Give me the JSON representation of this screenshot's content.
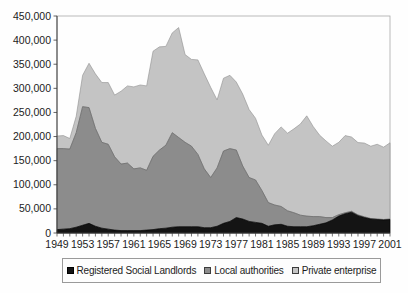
{
  "chart_data": {
    "type": "area",
    "stacked": true,
    "title": "",
    "xlabel": "",
    "ylabel": "",
    "grid": false,
    "legend_position": "bottom",
    "ylim": [
      0,
      450000
    ],
    "ytick_step": 50000,
    "ytick_labels": [
      "0",
      "50,000",
      "100,000",
      "150,000",
      "200,000",
      "250,000",
      "300,000",
      "350,000",
      "400,000",
      "450,000"
    ],
    "xtick_labels": [
      "1949",
      "1953",
      "1957",
      "1961",
      "1965",
      "1969",
      "1973",
      "1977",
      "1981",
      "1985",
      "1989",
      "1993",
      "1997",
      "2001"
    ],
    "x": [
      1949,
      1950,
      1951,
      1952,
      1953,
      1954,
      1955,
      1956,
      1957,
      1958,
      1959,
      1960,
      1961,
      1962,
      1963,
      1964,
      1965,
      1966,
      1967,
      1968,
      1969,
      1970,
      1971,
      1972,
      1973,
      1974,
      1975,
      1976,
      1977,
      1978,
      1979,
      1980,
      1981,
      1982,
      1983,
      1984,
      1985,
      1986,
      1987,
      1988,
      1989,
      1990,
      1991,
      1992,
      1993,
      1994,
      1995,
      1996,
      1997,
      1998,
      1999,
      2000,
      2001
    ],
    "series": [
      {
        "name": "Registered Social Landlords",
        "color": "#141414",
        "values": [
          7000,
          8000,
          9000,
          12000,
          16000,
          20000,
          14000,
          10000,
          8000,
          6000,
          5000,
          5000,
          5000,
          5000,
          6000,
          7000,
          9000,
          10000,
          12000,
          13000,
          13000,
          13000,
          13000,
          11000,
          11000,
          14000,
          20000,
          24000,
          32000,
          29000,
          24000,
          22000,
          20000,
          14000,
          17000,
          18000,
          14000,
          13000,
          13000,
          13000,
          15000,
          18000,
          21000,
          27000,
          35000,
          40000,
          43000,
          36000,
          32000,
          29000,
          28000,
          27000,
          28000
        ]
      },
      {
        "name": "Local authorities",
        "color": "#8c8c8c",
        "values": [
          168000,
          167000,
          165000,
          196000,
          246000,
          240000,
          203000,
          178000,
          176000,
          152000,
          138000,
          140000,
          128000,
          130000,
          124000,
          152000,
          163000,
          172000,
          196000,
          185000,
          175000,
          167000,
          150000,
          122000,
          104000,
          121000,
          150000,
          151000,
          140000,
          110000,
          91000,
          88000,
          68000,
          49000,
          41000,
          37000,
          32000,
          29000,
          24000,
          22000,
          19000,
          16000,
          11000,
          5000,
          3000,
          2000,
          2000,
          1500,
          1500,
          1000,
          1000,
          1000,
          1000
        ]
      },
      {
        "name": "Private enterprise",
        "color": "#c4c4c4",
        "values": [
          26000,
          27000,
          22000,
          34000,
          65000,
          92000,
          113000,
          124000,
          128000,
          128000,
          151000,
          160000,
          170000,
          172000,
          175000,
          218000,
          214000,
          205000,
          207000,
          228000,
          182000,
          180000,
          196000,
          197000,
          187000,
          141000,
          151000,
          152000,
          141000,
          149000,
          141000,
          128000,
          115000,
          119000,
          148000,
          165000,
          161000,
          174000,
          189000,
          208000,
          187000,
          169000,
          159000,
          148000,
          150000,
          160000,
          154000,
          150000,
          153000,
          150000,
          155000,
          150000,
          158000
        ]
      }
    ]
  }
}
